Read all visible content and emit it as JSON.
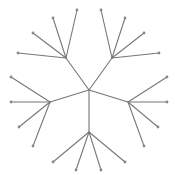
{
  "diagram": {
    "type": "radial-tree",
    "colors": {
      "edge": "#777777",
      "node": "#888888",
      "background": "#ffffff"
    },
    "root": "root",
    "nodes": [
      {
        "id": "root",
        "role": "root"
      },
      {
        "id": "hub-upper-left",
        "role": "hub",
        "parent": "root"
      },
      {
        "id": "hub-upper-right",
        "role": "hub",
        "parent": "root"
      },
      {
        "id": "hub-left",
        "role": "hub",
        "parent": "root"
      },
      {
        "id": "hub-right",
        "role": "hub",
        "parent": "root"
      },
      {
        "id": "hub-bottom",
        "role": "hub",
        "parent": "root"
      },
      {
        "id": "ul-1",
        "role": "leaf",
        "parent": "hub-upper-left"
      },
      {
        "id": "ul-2",
        "role": "leaf",
        "parent": "hub-upper-left"
      },
      {
        "id": "ul-3",
        "role": "leaf",
        "parent": "hub-upper-left"
      },
      {
        "id": "ul-4",
        "role": "leaf",
        "parent": "hub-upper-left"
      },
      {
        "id": "ur-1",
        "role": "leaf",
        "parent": "hub-upper-right"
      },
      {
        "id": "ur-2",
        "role": "leaf",
        "parent": "hub-upper-right"
      },
      {
        "id": "ur-3",
        "role": "leaf",
        "parent": "hub-upper-right"
      },
      {
        "id": "ur-4",
        "role": "leaf",
        "parent": "hub-upper-right"
      },
      {
        "id": "l-1",
        "role": "leaf",
        "parent": "hub-left"
      },
      {
        "id": "l-2",
        "role": "leaf",
        "parent": "hub-left"
      },
      {
        "id": "l-3",
        "role": "leaf",
        "parent": "hub-left"
      },
      {
        "id": "l-4",
        "role": "leaf",
        "parent": "hub-left"
      },
      {
        "id": "r-1",
        "role": "leaf",
        "parent": "hub-right"
      },
      {
        "id": "r-2",
        "role": "leaf",
        "parent": "hub-right"
      },
      {
        "id": "r-3",
        "role": "leaf",
        "parent": "hub-right"
      },
      {
        "id": "r-4",
        "role": "leaf",
        "parent": "hub-right"
      },
      {
        "id": "b-1",
        "role": "leaf",
        "parent": "hub-bottom"
      },
      {
        "id": "b-2",
        "role": "leaf",
        "parent": "hub-bottom"
      },
      {
        "id": "b-3",
        "role": "leaf",
        "parent": "hub-bottom"
      },
      {
        "id": "b-4",
        "role": "leaf",
        "parent": "hub-bottom"
      }
    ]
  }
}
